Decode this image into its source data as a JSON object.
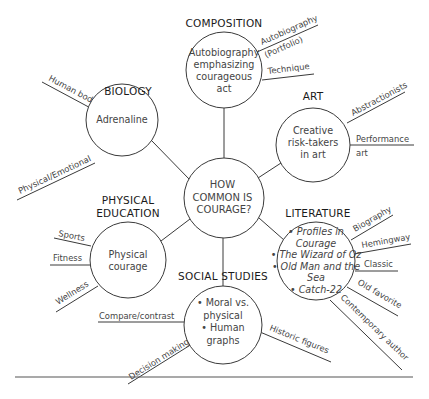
{
  "center": {
    "lines": [
      "HOW",
      "COMMON IS",
      "COURAGE?"
    ],
    "cx": 224,
    "cy": 198,
    "r": 40
  },
  "nodes": [
    {
      "id": "composition",
      "heading": "COMPOSITION",
      "cx": 224,
      "cy": 70,
      "r": 38,
      "heading_pos": [
        224,
        27
      ],
      "lines": [
        {
          "text": "Autobiography",
          "italic": false
        },
        {
          "text": "emphasizing",
          "italic": false
        },
        {
          "text": "courageous",
          "italic": false
        },
        {
          "text": "act",
          "italic": false
        }
      ],
      "line_start_y": 56,
      "line_step": 12,
      "branches": [
        {
          "label": "Autobiography",
          "x1": 257,
          "y1": 52,
          "x2": 318,
          "y2": 25,
          "tx": 262,
          "ty": 45,
          "angle": -24
        },
        {
          "label": "(Portfolio)",
          "x1": 0,
          "y1": 0,
          "x2": 0,
          "y2": 0,
          "tx": 266,
          "ty": 58,
          "angle": -24,
          "text_only": true
        },
        {
          "label": "Technique",
          "x1": 262,
          "y1": 80,
          "x2": 314,
          "y2": 74,
          "tx": 268,
          "ty": 74,
          "angle": -7
        }
      ]
    },
    {
      "id": "biology",
      "heading": "BIOLOGY",
      "cx": 122,
      "cy": 120,
      "r": 36,
      "heading_pos": [
        128,
        95
      ],
      "lines": [
        {
          "text": "Adrenaline",
          "italic": false
        }
      ],
      "line_start_y": 123,
      "line_step": 12,
      "branches": [
        {
          "label": "Human body",
          "x1": 98,
          "y1": 112,
          "x2": 42,
          "y2": 82,
          "tx": 48,
          "ty": 80,
          "angle": 28
        },
        {
          "label": "Physical/Emotional",
          "x1": 95,
          "y1": 163,
          "x2": 17,
          "y2": 200,
          "tx": 20,
          "ty": 194,
          "angle": -25
        }
      ]
    },
    {
      "id": "art",
      "heading": "ART",
      "cx": 313,
      "cy": 145,
      "r": 37,
      "heading_pos": [
        313,
        100
      ],
      "lines": [
        {
          "text": "Creative",
          "italic": false
        },
        {
          "text": "risk-takers",
          "italic": false
        },
        {
          "text": "in art",
          "italic": false
        }
      ],
      "line_start_y": 134,
      "line_step": 12,
      "branches": [
        {
          "label": "Abstractionists",
          "x1": 347,
          "y1": 123,
          "x2": 405,
          "y2": 92,
          "tx": 353,
          "ty": 116,
          "angle": -28
        },
        {
          "label": "Performance",
          "x1": 350,
          "y1": 145,
          "x2": 414,
          "y2": 145,
          "tx": 356,
          "ty": 142,
          "angle": 0
        },
        {
          "label": "art",
          "x1": 0,
          "y1": 0,
          "x2": 0,
          "y2": 0,
          "tx": 356,
          "ty": 156,
          "angle": 0,
          "text_only": true
        }
      ]
    },
    {
      "id": "literature",
      "heading": "LITERATURE",
      "cx": 316,
      "cy": 261,
      "r": 39,
      "heading_pos": [
        318,
        217
      ],
      "lines": [
        {
          "text": "• Profiles in",
          "italic": true
        },
        {
          "text": "Courage",
          "italic": true
        },
        {
          "text": "• The Wizard of Oz",
          "italic": true
        },
        {
          "text": "• Old Man and the",
          "italic": true
        },
        {
          "text": "Sea",
          "italic": true
        },
        {
          "text": "• Catch-22",
          "italic": true
        }
      ],
      "line_start_y": 235,
      "line_step": 11.5,
      "branches": [
        {
          "label": "Biography",
          "x1": 351,
          "y1": 240,
          "x2": 393,
          "y2": 215,
          "tx": 355,
          "ty": 232,
          "angle": -30
        },
        {
          "label": "Hemingway",
          "x1": 354,
          "y1": 254,
          "x2": 411,
          "y2": 244,
          "tx": 362,
          "ty": 248,
          "angle": -10
        },
        {
          "label": "Classic",
          "x1": 355,
          "y1": 271,
          "x2": 398,
          "y2": 271,
          "tx": 364,
          "ty": 267,
          "angle": 0
        },
        {
          "label": "Old favorite",
          "x1": 347,
          "y1": 287,
          "x2": 398,
          "y2": 316,
          "tx": 357,
          "ty": 284,
          "angle": 30
        },
        {
          "label": "Contemporary author",
          "x1": 330,
          "y1": 300,
          "x2": 402,
          "y2": 370,
          "tx": 340,
          "ty": 298,
          "angle": 44
        }
      ]
    },
    {
      "id": "physical-education",
      "heading": "PHYSICAL",
      "heading2": "EDUCATION",
      "cx": 128,
      "cy": 260,
      "r": 38,
      "heading_pos": [
        128,
        204
      ],
      "lines": [
        {
          "text": "Physical",
          "italic": false
        },
        {
          "text": "courage",
          "italic": false
        }
      ],
      "line_start_y": 258,
      "line_step": 12,
      "branches": [
        {
          "label": "Sports",
          "x1": 91,
          "y1": 246,
          "x2": 54,
          "y2": 238,
          "tx": 58,
          "ty": 236,
          "angle": 11
        },
        {
          "label": "Fitness",
          "x1": 90,
          "y1": 265,
          "x2": 50,
          "y2": 265,
          "tx": 53,
          "ty": 261,
          "angle": 0
        },
        {
          "label": "Wellness",
          "x1": 98,
          "y1": 286,
          "x2": 56,
          "y2": 312,
          "tx": 58,
          "ty": 305,
          "angle": -32
        }
      ]
    },
    {
      "id": "social-studies",
      "heading": "SOCIAL STUDIES",
      "cx": 223,
      "cy": 325,
      "r": 39,
      "heading_pos": [
        223,
        280
      ],
      "lines": [
        {
          "text": "• Moral vs.",
          "italic": false
        },
        {
          "text": "physical",
          "italic": false
        },
        {
          "text": "• Human",
          "italic": false
        },
        {
          "text": "graphs",
          "italic": false
        }
      ],
      "line_start_y": 306,
      "line_step": 12.5,
      "branches": [
        {
          "label": "Compare/contrast",
          "x1": 184,
          "y1": 322,
          "x2": 98,
          "y2": 322,
          "tx": 99,
          "ty": 319,
          "angle": 0
        },
        {
          "label": "Decision making",
          "x1": 192,
          "y1": 344,
          "x2": 128,
          "y2": 384,
          "tx": 131,
          "ty": 380,
          "angle": -32
        },
        {
          "label": "Historic figures",
          "x1": 260,
          "y1": 332,
          "x2": 331,
          "y2": 362,
          "tx": 269,
          "ty": 330,
          "angle": 22
        }
      ]
    }
  ],
  "spokes": [
    {
      "x1": 224,
      "y1": 108,
      "x2": 224,
      "y2": 158
    },
    {
      "x1": 152,
      "y1": 141,
      "x2": 190,
      "y2": 180
    },
    {
      "x1": 281,
      "y1": 163,
      "x2": 258,
      "y2": 178
    },
    {
      "x1": 284,
      "y1": 240,
      "x2": 259,
      "y2": 218
    },
    {
      "x1": 161,
      "y1": 241,
      "x2": 190,
      "y2": 219
    },
    {
      "x1": 223,
      "y1": 286,
      "x2": 223,
      "y2": 238
    }
  ],
  "rule": {
    "x1": 15,
    "y1": 377,
    "x2": 413,
    "y2": 377
  }
}
